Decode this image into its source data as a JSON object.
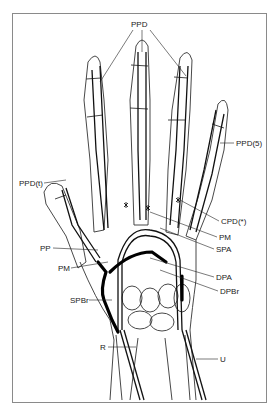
{
  "figure": {
    "type": "anatomical-line-drawing",
    "labels": {
      "ppd_top": "PPD",
      "ppd5": "PPD(5)",
      "ppdt": "PPD(t)",
      "cpd": "CPD(*)",
      "pm_right": "PM",
      "spa": "SPA",
      "pp": "PP",
      "pm_left": "PM",
      "dpa": "DPA",
      "dpbr": "DPBr",
      "spbr": "SPBr",
      "r": "R",
      "u": "U"
    },
    "caption": ""
  },
  "colors": {
    "line": "#222222",
    "frame": "#8a8a8a",
    "background": "#ffffff"
  }
}
